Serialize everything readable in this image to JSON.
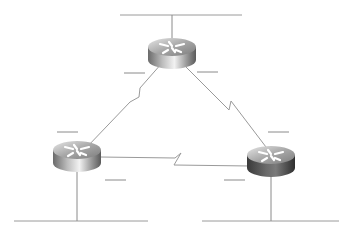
{
  "diagram": {
    "type": "network-topology",
    "colors": {
      "line": "#9a9a9a",
      "label_dash": "#8a8a8a",
      "router_top_light": "#d8d8d8",
      "router_top_dark": "#7a7a7a",
      "router_side_light": "#e8e8e8",
      "router_side_dark": "#555555"
    },
    "routers": [
      {
        "id": "router-top",
        "cx": 172,
        "cy": 52
      },
      {
        "id": "router-left",
        "cx": 77,
        "cy": 155
      },
      {
        "id": "router-right",
        "cx": 271,
        "cy": 160
      }
    ],
    "lan_segments": [
      {
        "id": "lan-top",
        "x1": 120,
        "x2": 242,
        "y": 15,
        "drop_x": 172
      },
      {
        "id": "lan-left",
        "x1": 14,
        "x2": 148,
        "y": 221,
        "drop_x": 77
      },
      {
        "id": "lan-right",
        "x1": 202,
        "x2": 339,
        "y": 221,
        "drop_x": 271
      }
    ],
    "serial_links": [
      {
        "id": "link-top-left",
        "from": "router-top",
        "to": "router-left"
      },
      {
        "id": "link-top-right",
        "from": "router-top",
        "to": "router-right"
      },
      {
        "id": "link-left-right",
        "from": "router-left",
        "to": "router-right"
      }
    ],
    "label_placeholders": [
      {
        "id": "blank-top-left",
        "x": 124,
        "y": 72,
        "w": 20
      },
      {
        "id": "blank-top-right",
        "x": 198,
        "y": 72,
        "w": 20
      },
      {
        "id": "blank-left-upper",
        "x": 57,
        "y": 131,
        "w": 20
      },
      {
        "id": "blank-left-lower",
        "x": 105,
        "y": 180,
        "w": 20
      },
      {
        "id": "blank-right-upper",
        "x": 268,
        "y": 132,
        "w": 20
      },
      {
        "id": "blank-right-lower",
        "x": 225,
        "y": 180,
        "w": 20
      }
    ]
  }
}
